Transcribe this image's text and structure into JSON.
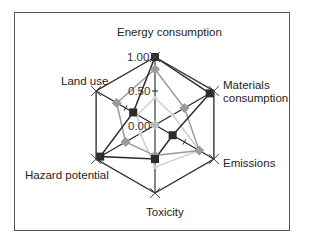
{
  "chart_data": {
    "type": "radar",
    "title": "",
    "axes": [
      "Energy consumption",
      "Materials consumption",
      "Emissions",
      "Toxicity",
      "Hazard potential",
      "Land use"
    ],
    "radial_ticks": [
      "0.00",
      "0.50",
      "1.00"
    ],
    "rlim": [
      0,
      1
    ],
    "series": [
      {
        "name": "Series 1 (dark squares)",
        "color": "#2b2b2b",
        "marker": "square",
        "values": [
          1.0,
          0.93,
          0.3,
          0.5,
          0.93,
          0.37
        ]
      },
      {
        "name": "Series 2 (gray diamonds)",
        "color": "#9a9a9a",
        "marker": "diamond",
        "values": [
          0.82,
          0.5,
          0.75,
          0.45,
          0.5,
          0.65
        ]
      },
      {
        "name": "Series 3 (light gray)",
        "color": "#cfcfcf",
        "marker": "circle",
        "values": [
          0.4,
          0.3,
          0.75,
          0.62,
          0.25,
          0.3
        ]
      }
    ],
    "outer_frame": {
      "value": 1.0,
      "color": "#333333",
      "vertex_marker": "x"
    },
    "legend": "none",
    "grid": false
  },
  "labels": {
    "energy": "Energy consumption",
    "materials_line1": "Materials",
    "materials_line2": "consumption",
    "emissions": "Emissions",
    "toxicity": "Toxicity",
    "hazard": "Hazard potential",
    "land": "Land use",
    "tick_100": "1.00",
    "tick_050": "0.50",
    "tick_000": "0.00"
  }
}
